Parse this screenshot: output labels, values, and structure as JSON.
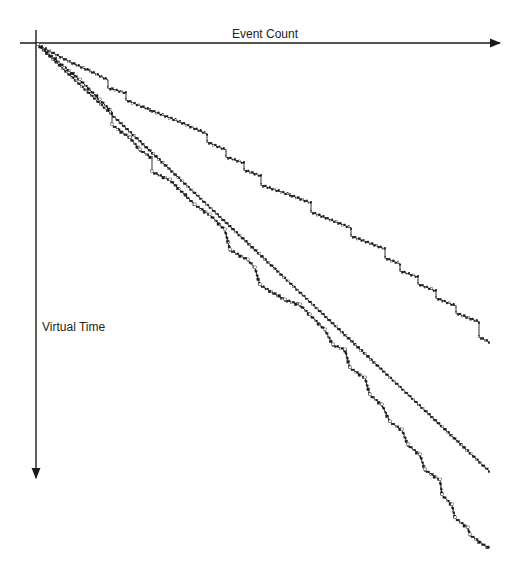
{
  "figure": {
    "x_axis_label": "Event Count",
    "y_axis_label": "Virtual Time",
    "colors": {
      "line": "#1a1a1a",
      "background": "#ffffff"
    },
    "origin": [
      38,
      45
    ],
    "x_axis": {
      "y": 43,
      "x_start": 20,
      "x_end": 500
    },
    "y_axis": {
      "x": 36,
      "y_start": 30,
      "y_end": 478
    },
    "curves": [
      {
        "name": "top-staircase",
        "points": [
          [
            38,
            45
          ],
          [
            70,
            62
          ],
          [
            90,
            71
          ],
          [
            108,
            80
          ],
          [
            108,
            88
          ],
          [
            126,
            93
          ],
          [
            126,
            100
          ],
          [
            150,
            110
          ],
          [
            180,
            122
          ],
          [
            207,
            134
          ],
          [
            207,
            142
          ],
          [
            226,
            150
          ],
          [
            226,
            157
          ],
          [
            244,
            163
          ],
          [
            244,
            170
          ],
          [
            261,
            176
          ],
          [
            261,
            185
          ],
          [
            290,
            195
          ],
          [
            311,
            203
          ],
          [
            311,
            212
          ],
          [
            351,
            228
          ],
          [
            351,
            236
          ],
          [
            385,
            249
          ],
          [
            385,
            258
          ],
          [
            400,
            264
          ],
          [
            400,
            271
          ],
          [
            418,
            277
          ],
          [
            418,
            284
          ],
          [
            436,
            291
          ],
          [
            436,
            298
          ],
          [
            456,
            306
          ],
          [
            456,
            313
          ],
          [
            479,
            322
          ],
          [
            479,
            337
          ],
          [
            489,
            342
          ]
        ]
      },
      {
        "name": "straight-diagonal",
        "points": [
          [
            38,
            45
          ],
          [
            489,
            471
          ]
        ]
      },
      {
        "name": "bottom-staircase",
        "points": [
          [
            38,
            45
          ],
          [
            80,
            80
          ],
          [
            100,
            100
          ],
          [
            112,
            112
          ],
          [
            112,
            125
          ],
          [
            130,
            138
          ],
          [
            140,
            150
          ],
          [
            152,
            158
          ],
          [
            152,
            172
          ],
          [
            170,
            180
          ],
          [
            195,
            205
          ],
          [
            210,
            215
          ],
          [
            225,
            230
          ],
          [
            230,
            250
          ],
          [
            248,
            260
          ],
          [
            255,
            268
          ],
          [
            260,
            285
          ],
          [
            285,
            300
          ],
          [
            300,
            305
          ],
          [
            310,
            315
          ],
          [
            325,
            330
          ],
          [
            333,
            345
          ],
          [
            345,
            350
          ],
          [
            350,
            368
          ],
          [
            365,
            378
          ],
          [
            370,
            395
          ],
          [
            382,
            405
          ],
          [
            390,
            422
          ],
          [
            402,
            430
          ],
          [
            408,
            445
          ],
          [
            420,
            455
          ],
          [
            425,
            470
          ],
          [
            440,
            480
          ],
          [
            442,
            495
          ],
          [
            452,
            505
          ],
          [
            455,
            518
          ],
          [
            468,
            528
          ],
          [
            470,
            535
          ],
          [
            488,
            548
          ]
        ]
      }
    ],
    "dot_markers": {
      "top-staircase": true,
      "straight-diagonal": true,
      "bottom-staircase": true
    }
  }
}
